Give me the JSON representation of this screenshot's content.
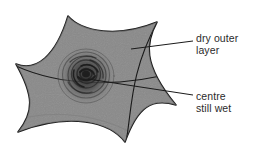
{
  "figure": {
    "kind": "diagram",
    "background_color": "#ffffff"
  },
  "shape": {
    "name": "drying-patch",
    "fill_color": "#8a8a8a",
    "outline_color": "#1a1a1a",
    "outline_width": 1.6,
    "points": 6
  },
  "centre": {
    "name": "wet-centre",
    "fill_color": "#3c3c3c",
    "ring_color": "#2a2a2a",
    "rings": 6
  },
  "labels": [
    {
      "id": "dry-outer-layer",
      "lines": [
        "dry outer",
        "layer"
      ],
      "text": "dry outer layer",
      "color": "#2b2b2b",
      "leader": {
        "from_x": 193,
        "from_y": 41,
        "to_x": 131,
        "to_y": 49
      }
    },
    {
      "id": "centre-still-wet",
      "lines": [
        "centre",
        "still wet"
      ],
      "text": "centre still wet",
      "color": "#2b2b2b",
      "leader": {
        "from_x": 193,
        "from_y": 95,
        "to_x": 88,
        "to_y": 79
      }
    }
  ]
}
